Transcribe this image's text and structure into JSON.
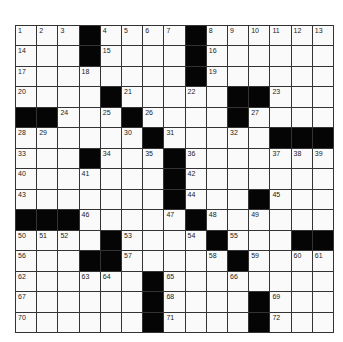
{
  "puzzle": {
    "rows": 15,
    "cols": 15,
    "colors": {
      "black": "#050505",
      "white": "#fafafa",
      "line": "#333333"
    },
    "grid": [
      [
        "1",
        "2",
        "3",
        "#",
        "4",
        "5",
        "6",
        "7",
        "#",
        "8",
        "9",
        "10",
        "11",
        "12",
        "13"
      ],
      [
        "14",
        "",
        "",
        "#",
        "15",
        "",
        "",
        "",
        "#",
        "16",
        "",
        "",
        "",
        "",
        ""
      ],
      [
        "17",
        "",
        "",
        "18",
        "",
        "",
        "",
        "",
        "#",
        "19",
        "",
        "",
        "",
        "",
        ""
      ],
      [
        "20",
        "",
        "",
        "",
        "#",
        "21",
        "",
        "",
        "22",
        "",
        "#",
        "#",
        "23",
        "",
        ""
      ],
      [
        "#",
        "#",
        "24",
        "",
        "25",
        "#",
        "26",
        "",
        "",
        "",
        "#",
        "27",
        "",
        "",
        ""
      ],
      [
        "28",
        "29",
        "",
        "",
        "",
        "30",
        "#",
        "31",
        "",
        "",
        "32",
        "",
        "#",
        "#",
        "#"
      ],
      [
        "33",
        "",
        "",
        "#",
        "34",
        "",
        "35",
        "#",
        "36",
        "",
        "",
        "",
        "37",
        "38",
        "39"
      ],
      [
        "40",
        "",
        "",
        "41",
        "",
        "",
        "",
        "#",
        "42",
        "",
        "",
        "",
        "",
        "",
        ""
      ],
      [
        "43",
        "",
        "",
        "",
        "",
        "",
        "",
        "#",
        "44",
        "",
        "",
        "#",
        "45",
        "",
        ""
      ],
      [
        "#",
        "#",
        "#",
        "46",
        "",
        "",
        "",
        "47",
        "#",
        "48",
        "",
        "49",
        "",
        "",
        ""
      ],
      [
        "50",
        "51",
        "52",
        "",
        "#",
        "53",
        "",
        "",
        "54",
        "#",
        "55",
        "",
        "",
        "#",
        "#"
      ],
      [
        "56",
        "",
        "",
        "#",
        "#",
        "57",
        "",
        "",
        "",
        "58",
        "#",
        "59",
        "",
        "60",
        "61"
      ],
      [
        "62",
        "",
        "",
        "63",
        "64",
        "",
        "#",
        "65",
        "",
        "",
        "66",
        "",
        "",
        "",
        ""
      ],
      [
        "67",
        "",
        "",
        "",
        "",
        "",
        "#",
        "68",
        "",
        "",
        "",
        "#",
        "69",
        "",
        ""
      ],
      [
        "70",
        "",
        "",
        "",
        "",
        "",
        "#",
        "71",
        "",
        "",
        "",
        "#",
        "72",
        "",
        ""
      ]
    ]
  }
}
